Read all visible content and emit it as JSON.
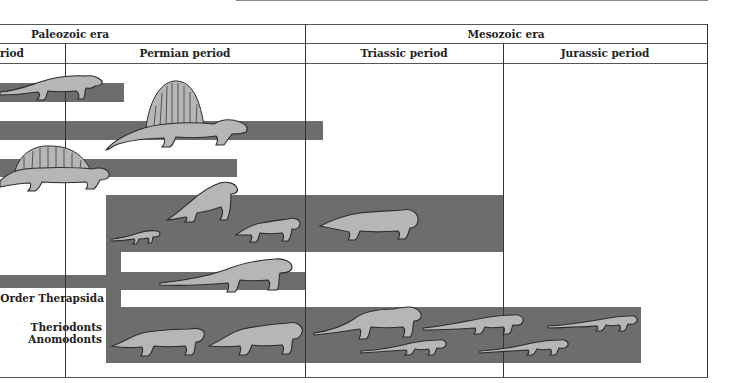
{
  "figure": {
    "eras": [
      {
        "label": "Paleozoic era"
      },
      {
        "label": "Mesozoic era"
      }
    ],
    "periods": [
      {
        "label": "riod"
      },
      {
        "label": "Permian period"
      },
      {
        "label": "Triassic period"
      },
      {
        "label": "Jurassic period"
      }
    ],
    "group_labels": {
      "order": "Order Therapsida",
      "theriodonts": "Theriodonts",
      "anomodonts": "Anomodonts"
    },
    "colors": {
      "bar": "#6d6d6d",
      "animal_fill": "#b6b6b6",
      "grid": "#333333"
    },
    "lineages": [
      {
        "name": "lineage-1",
        "animal": "pelycosaur-lizardlike",
        "start_period": "Carboniferous (cut off)",
        "end_period": "Early Permian"
      },
      {
        "name": "lineage-2",
        "animal": "dimetrodon-sail-back",
        "start_period": "Carboniferous (cut off)",
        "end_period": "Earliest Triassic"
      },
      {
        "name": "lineage-3",
        "animal": "edaphosaurus-sail-back",
        "start_period": "Carboniferous (cut off)",
        "end_period": "Late Permian"
      },
      {
        "name": "therapsida-upper",
        "animals": [
          "small therapsid",
          "dinocephalian",
          "dicynodont",
          "lystrosaurus-like"
        ],
        "start_period": "Permian",
        "end_period": "End Triassic"
      },
      {
        "name": "therapsida-middle",
        "animal": "theriodont",
        "start_period": "Permian",
        "end_period": "Late Permian"
      },
      {
        "name": "therapsida-lower",
        "animals": [
          "anomodont",
          "theriodont",
          "cynodont",
          "cynodont",
          "mammal-like",
          "mammal-like",
          "mammal-like"
        ],
        "start_period": "Permian",
        "end_period": "Mid Jurassic"
      }
    ]
  }
}
